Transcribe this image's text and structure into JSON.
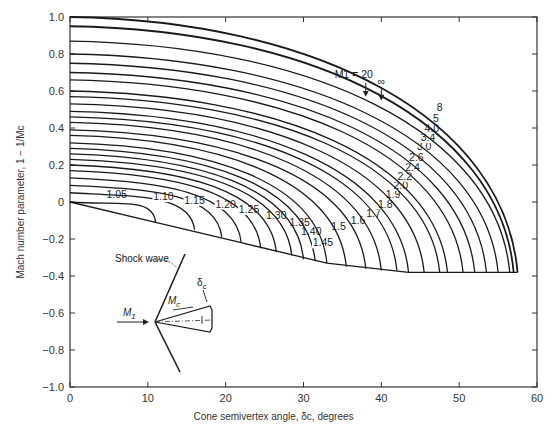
{
  "chart_data": {
    "type": "line",
    "title": "",
    "xlabel": "Cone semivertex angle, δc, degrees",
    "ylabel": "Mach number parameter, 1 − 1/Mc",
    "xlim": [
      0,
      60
    ],
    "ylim": [
      -1.0,
      1.0
    ],
    "x_ticks": [
      "0",
      "10",
      "20",
      "30",
      "40",
      "50",
      "60"
    ],
    "y_ticks": [
      "1.0",
      "0.8",
      "0.6",
      "0.4",
      "0.2",
      "0",
      "−0.2",
      "−0.4",
      "−0.6",
      "−0.8",
      "−1.0"
    ],
    "legend_annotation": "M1 = 20",
    "infinity_label": "∞",
    "series": [
      {
        "name": "1.05",
        "start_y": 0.0,
        "end_x": 11,
        "end_y": -0.11
      },
      {
        "name": "1.10",
        "start_y": 0.05,
        "end_x": 16,
        "end_y": -0.15
      },
      {
        "name": "1.15",
        "start_y": 0.09,
        "end_x": 19.5,
        "end_y": -0.19
      },
      {
        "name": "1.20",
        "start_y": 0.13,
        "end_x": 22,
        "end_y": -0.22
      },
      {
        "name": "1.25",
        "start_y": 0.17,
        "end_x": 24.5,
        "end_y": -0.25
      },
      {
        "name": "1.30",
        "start_y": 0.2,
        "end_x": 26.5,
        "end_y": -0.27
      },
      {
        "name": "1.35",
        "start_y": 0.23,
        "end_x": 28.5,
        "end_y": -0.29
      },
      {
        "name": "1.40",
        "start_y": 0.26,
        "end_x": 30,
        "end_y": -0.31
      },
      {
        "name": "1.45",
        "start_y": 0.29,
        "end_x": 31.5,
        "end_y": -0.32
      },
      {
        "name": "1.5",
        "start_y": 0.32,
        "end_x": 33,
        "end_y": -0.33
      },
      {
        "name": "1.6",
        "start_y": 0.36,
        "end_x": 35.5,
        "end_y": -0.35
      },
      {
        "name": "1.7",
        "start_y": 0.39,
        "end_x": 38,
        "end_y": -0.36
      },
      {
        "name": "1.8",
        "start_y": 0.43,
        "end_x": 40,
        "end_y": -0.37
      },
      {
        "name": "1.9",
        "start_y": 0.46,
        "end_x": 42,
        "end_y": -0.37
      },
      {
        "name": "2.0",
        "start_y": 0.49,
        "end_x": 43.5,
        "end_y": -0.38
      },
      {
        "name": "2.2",
        "start_y": 0.53,
        "end_x": 45.5,
        "end_y": -0.38
      },
      {
        "name": "2.4",
        "start_y": 0.57,
        "end_x": 47.5,
        "end_y": -0.38
      },
      {
        "name": "2.6",
        "start_y": 0.6,
        "end_x": 48.5,
        "end_y": -0.38
      },
      {
        "name": "3.0",
        "start_y": 0.66,
        "end_x": 50.5,
        "end_y": -0.38
      },
      {
        "name": "3.4",
        "start_y": 0.7,
        "end_x": 52,
        "end_y": -0.38
      },
      {
        "name": "4.0",
        "start_y": 0.75,
        "end_x": 53.5,
        "end_y": -0.38
      },
      {
        "name": "5",
        "start_y": 0.8,
        "end_x": 55,
        "end_y": -0.38
      },
      {
        "name": "8",
        "start_y": 0.87,
        "end_x": 56.5,
        "end_y": -0.38
      },
      {
        "name": "20",
        "start_y": 0.95,
        "end_x": 57,
        "end_y": -0.38
      },
      {
        "name": "∞",
        "start_y": 1.0,
        "end_x": 57.5,
        "end_y": -0.38
      }
    ],
    "envelope": {
      "name": "detachment limit",
      "points": [
        [
          0,
          0
        ],
        [
          11,
          -0.11
        ],
        [
          22,
          -0.22
        ],
        [
          33,
          -0.33
        ],
        [
          43.5,
          -0.38
        ],
        [
          57.5,
          -0.38
        ]
      ]
    },
    "grid": false,
    "legend_position": "inline labels"
  },
  "inset": {
    "shock_label": "Shock wave",
    "freestream_label": "M",
    "freestream_sub": "1",
    "cone_mach_label": "M",
    "cone_mach_sub": "c",
    "angle_label": "δ",
    "angle_sub": "c"
  },
  "caption_partial": ""
}
